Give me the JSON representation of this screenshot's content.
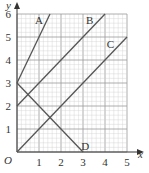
{
  "chart_data": {
    "type": "line",
    "title": "",
    "xlabel": "x",
    "ylabel": "y",
    "origin_label": "O",
    "xlim": [
      0,
      5
    ],
    "ylim": [
      0,
      6
    ],
    "x_ticks": [
      "1",
      "2",
      "3",
      "4",
      "5"
    ],
    "y_ticks": [
      "1",
      "2",
      "3",
      "4",
      "5",
      "6"
    ],
    "grid": true,
    "minor_grid_step": 0.2,
    "series": [
      {
        "name": "A",
        "points": [
          [
            0,
            3
          ],
          [
            1.5,
            6
          ]
        ],
        "label_at": [
          1.0,
          5.75
        ]
      },
      {
        "name": "B",
        "points": [
          [
            0,
            2
          ],
          [
            4,
            6
          ]
        ],
        "label_at": [
          3.3,
          5.75
        ]
      },
      {
        "name": "C",
        "points": [
          [
            0,
            0
          ],
          [
            5,
            5
          ]
        ],
        "label_at": [
          4.25,
          4.7
        ]
      },
      {
        "name": "D",
        "points": [
          [
            0,
            3
          ],
          [
            3,
            0
          ]
        ],
        "label_at": [
          3.1,
          0.25
        ]
      }
    ]
  },
  "colors": {
    "line": "#555555",
    "axis": "#333333",
    "grid_major": "#9a9a9a",
    "grid_minor": "#cfcfcf"
  }
}
